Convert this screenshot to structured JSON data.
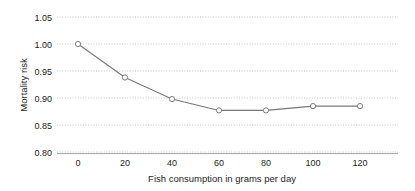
{
  "chart_data": {
    "type": "line",
    "title": "",
    "subtitle": "",
    "xlabel": "Fish consumption in grams per day",
    "ylabel": "Mortality risk",
    "x": [
      0,
      20,
      40,
      60,
      80,
      100,
      120
    ],
    "values": [
      1.0,
      0.938,
      0.898,
      0.877,
      0.877,
      0.885,
      0.885
    ],
    "series": [
      {
        "name": "Mortality risk",
        "values": [
          1.0,
          0.938,
          0.898,
          0.877,
          0.877,
          0.885,
          0.885
        ]
      }
    ],
    "xlim": [
      -5,
      135
    ],
    "ylim": [
      0.8,
      1.05
    ],
    "x_ticks": [
      0,
      20,
      40,
      60,
      80,
      100,
      120
    ],
    "x_tick_labels": [
      "0",
      "20",
      "40",
      "60",
      "80",
      "100",
      "120"
    ],
    "y_ticks": [
      0.8,
      0.85,
      0.9,
      0.95,
      1.0,
      1.05
    ],
    "y_tick_labels": [
      "0.80",
      "0.85",
      "0.90",
      "0.95",
      "1.00",
      "1.05"
    ],
    "grid": "horizontal-dotted",
    "legend": "none",
    "marker": "open-circle",
    "line_color": "#77787b",
    "grid_color": "#b9b9b9",
    "axis_color": "#9a9a9a",
    "text_color": "#231f20"
  }
}
